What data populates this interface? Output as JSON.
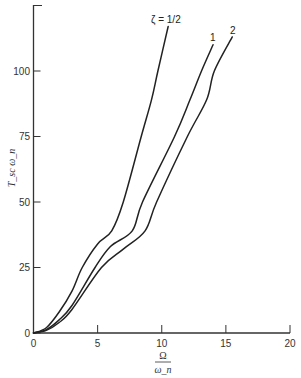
{
  "chart_data": {
    "type": "line",
    "title": "",
    "xlabel": "Ω / ω_n",
    "xlabel_numerator": "Ω",
    "xlabel_denominator": "ω_n",
    "ylabel": "T_sc ω_n",
    "xlim": [
      0,
      20
    ],
    "ylim": [
      0,
      125
    ],
    "xticks": [
      0,
      5,
      10,
      15,
      20
    ],
    "yticks": [
      0,
      25,
      50,
      75,
      100
    ],
    "grid": false,
    "legend": "inline labels at curve ends",
    "series": [
      {
        "name": "ζ = 1/2",
        "label": "ζ = 1/2",
        "x": [
          0,
          1,
          2,
          3,
          3.8,
          5,
          6.1,
          7.0,
          8.4,
          9.2,
          9.7,
          10.5
        ],
        "y": [
          0,
          2,
          8,
          16,
          25,
          34,
          39,
          50,
          75,
          89,
          100,
          117
        ]
      },
      {
        "name": "ζ = 1",
        "label": "1",
        "x": [
          0,
          1,
          2,
          3,
          4.8,
          6,
          7.7,
          8.5,
          11.0,
          12.2,
          13.1,
          14.0
        ],
        "y": [
          0,
          1.3,
          5,
          10.5,
          25,
          33,
          39,
          50,
          75,
          89,
          100,
          110
        ]
      },
      {
        "name": "ζ = 2",
        "label": "2",
        "x": [
          0,
          1,
          2,
          3,
          5.3,
          7,
          8.7,
          9.6,
          12.0,
          13.5,
          14.1,
          15.5
        ],
        "y": [
          0,
          1,
          4,
          9,
          25,
          32,
          39,
          50,
          75,
          89,
          100,
          113
        ]
      }
    ]
  }
}
